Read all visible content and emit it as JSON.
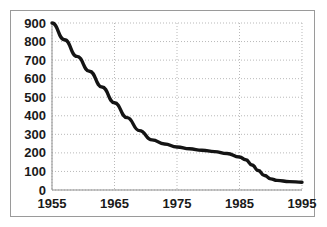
{
  "chart_data": {
    "type": "line",
    "title": "",
    "subtitle": "",
    "xlabel": "",
    "ylabel": "",
    "xlim": [
      1955,
      1995
    ],
    "ylim": [
      0,
      900
    ],
    "grid": true,
    "legend": false,
    "legend_position": "none",
    "line_color": "#141414",
    "grid_color": "#b9b9b9",
    "axis_color": "#8f8f8f",
    "background_color": "#ffffff",
    "x_ticks": [
      1955,
      1965,
      1975,
      1985,
      1995
    ],
    "x_tick_labels": [
      "1955",
      "1965",
      "1975",
      "1985",
      "1995"
    ],
    "y_ticks": [
      0,
      100,
      200,
      300,
      400,
      500,
      600,
      700,
      800,
      900
    ],
    "y_tick_labels": [
      "0",
      "100",
      "200",
      "300",
      "400",
      "500",
      "600",
      "700",
      "800",
      "900"
    ],
    "series": [
      {
        "name": "series-1",
        "x": [
          1955,
          1957,
          1959,
          1961,
          1963,
          1965,
          1967,
          1969,
          1971,
          1973,
          1975,
          1977,
          1979,
          1981,
          1983,
          1985,
          1986,
          1987,
          1988,
          1989,
          1990,
          1991,
          1993,
          1995
        ],
        "values": [
          900,
          810,
          720,
          640,
          555,
          470,
          390,
          320,
          270,
          248,
          232,
          222,
          214,
          207,
          197,
          178,
          163,
          135,
          105,
          78,
          60,
          52,
          45,
          42
        ]
      }
    ]
  }
}
